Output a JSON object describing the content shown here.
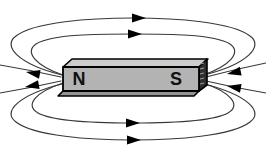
{
  "diagram": {
    "type": "bar-magnet-magnetic-field",
    "background_color": "#ffffff",
    "magnet": {
      "north_label": "N",
      "south_label": "S",
      "front_color": "#b3b3b3",
      "top_color": "#cccccc",
      "end_color": "#2e2e2e",
      "bottom_bevel_color": "#949494",
      "hatch_color": "#9a9a9a",
      "outline_color": "#000000",
      "label_color": "#111111"
    },
    "field_lines": {
      "line_color": "#383838",
      "arrow_color": "#000000",
      "loop_count": 4,
      "open_line_count": 4,
      "arrow_count": 8,
      "direction": "out of N pole, looping around into S pole"
    }
  }
}
